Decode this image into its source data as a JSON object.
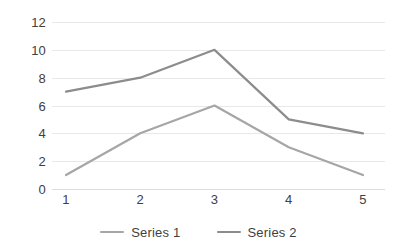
{
  "chart_data": {
    "type": "line",
    "title": "",
    "xlabel": "",
    "ylabel": "",
    "categories": [
      "1",
      "2",
      "3",
      "4",
      "5"
    ],
    "ylim": [
      0,
      12
    ],
    "yticks": [
      0,
      2,
      4,
      6,
      8,
      10,
      12
    ],
    "ytick_labels": [
      "0",
      "2",
      "4",
      "6",
      "8",
      "10",
      "12"
    ],
    "grid": "horizontal-only",
    "legend_position": "bottom-center",
    "markers": false,
    "series": [
      {
        "name": "Series 1",
        "values": [
          1,
          4,
          6,
          3,
          1
        ],
        "color": "#a6a6a6"
      },
      {
        "name": "Series 2",
        "values": [
          7,
          8,
          10,
          5,
          4
        ],
        "color": "#8c8c8c"
      }
    ]
  },
  "axis": {
    "y_tick_labels": [
      "12",
      "10",
      "8",
      "6",
      "4",
      "2",
      "0"
    ],
    "x_tick_labels": [
      "1",
      "2",
      "3",
      "4",
      "5"
    ]
  },
  "legend": {
    "items": [
      {
        "label": "Series 1"
      },
      {
        "label": "Series 2"
      }
    ]
  },
  "colors": {
    "gridline": "#e8e8e8",
    "baseline": "#dcdcdc",
    "axis_text": "#404040",
    "legend_text": "#3f3f3f",
    "series_1": "#a6a6a6",
    "series_2": "#8c8c8c",
    "background": "#ffffff"
  }
}
